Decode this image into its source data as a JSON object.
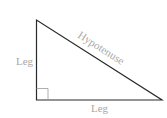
{
  "diagram": {
    "type": "right-triangle",
    "labels": {
      "left_leg": "Leg",
      "bottom_leg": "Leg",
      "hypotenuse": "Hypotenuse"
    },
    "colors": {
      "stroke": "#2a2a2a",
      "right_angle_marker": "#9a9a9a",
      "label": "#a8a8a8",
      "background": "#ffffff"
    }
  }
}
